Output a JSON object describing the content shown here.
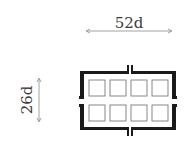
{
  "diagram": {
    "type": "architectural-plan",
    "width_label": "52d",
    "height_label": "26d",
    "grid": {
      "columns": 4,
      "rows": 2
    },
    "colors": {
      "wall": "#1a1a1a",
      "cell": "#7a7a7a",
      "dimension": "#8a8a8a",
      "text": "#3a3a3a"
    }
  }
}
